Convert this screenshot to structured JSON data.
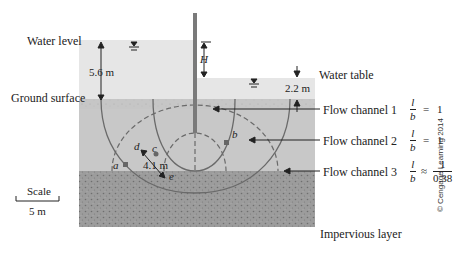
{
  "figure": {
    "labels": {
      "water_level": "Water level",
      "ground_surface": "Ground surface",
      "water_table": "Water table",
      "impervious_layer": "Impervious layer",
      "scale_title": "Scale",
      "scale_value": "5 m",
      "credit": "© Cengage Learning 2014"
    },
    "dimensions": {
      "upstream_depth": "5.6 m",
      "downstream_depth": "2.2 m",
      "head_difference": "H",
      "distance_de": "4.1 m"
    },
    "points": [
      "a",
      "b",
      "c",
      "d",
      "e"
    ],
    "flow_channels": [
      {
        "label": "Flow channel 1",
        "ratio_num": "l",
        "ratio_den": "b",
        "relation": "=",
        "value": "1"
      },
      {
        "label": "Flow channel 2",
        "ratio_num": "l",
        "ratio_den": "b",
        "relation": "=",
        "value": "1"
      },
      {
        "label": "Flow channel 3",
        "ratio_num": "l",
        "ratio_den": "b",
        "relation": "≈",
        "value_num": "1",
        "value_den": "0.38"
      }
    ],
    "colors": {
      "water": "#e6e6e6",
      "soil": "#c8c8c8",
      "impervious": "#9a9a9a",
      "flow_line": "#6a6a6a",
      "sheet_pile": "#7a7a7a"
    }
  }
}
